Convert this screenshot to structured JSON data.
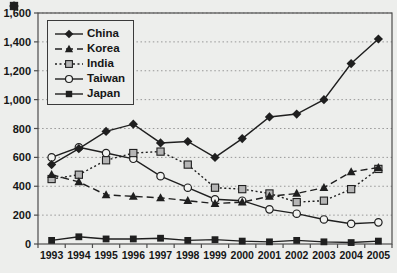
{
  "figure": {
    "background": "#edeeec",
    "ink": "#1f1f1f",
    "grid_color": "#979797",
    "border_color": "#4d4d4d",
    "india_fill": "#b5b5b5",
    "open_fill": "#f2f3f1"
  },
  "chart_data": {
    "type": "line",
    "title": "",
    "xlabel": "",
    "ylabel": "",
    "x": [
      1993,
      1994,
      1995,
      1996,
      1997,
      1998,
      1999,
      2000,
      2001,
      2002,
      2003,
      2004,
      2005
    ],
    "xtick_labels": [
      "1993",
      "1994",
      "1995",
      "1996",
      "1997",
      "1998",
      "1999",
      "2000",
      "2001",
      "2002",
      "2003",
      "2004",
      "2005"
    ],
    "ylim": [
      0,
      1600
    ],
    "ytick_step": 200,
    "ytick_labels": [
      "0",
      "200",
      "400",
      "600",
      "800",
      "1,000",
      "1,200",
      "1,400",
      "1,600"
    ],
    "grid": "horizontal-dotted",
    "legend_position": "top-left",
    "series": [
      {
        "name": "China",
        "marker": "diamond-filled",
        "line": "solid",
        "values": [
          550,
          660,
          780,
          830,
          700,
          710,
          600,
          730,
          880,
          900,
          1000,
          1250,
          1420
        ]
      },
      {
        "name": "Korea",
        "marker": "triangle-filled",
        "line": "dashed",
        "values": [
          480,
          430,
          340,
          330,
          320,
          300,
          280,
          290,
          330,
          350,
          390,
          500,
          530
        ]
      },
      {
        "name": "India",
        "marker": "square-open",
        "line": "dotted",
        "values": [
          450,
          480,
          580,
          630,
          640,
          550,
          390,
          380,
          350,
          290,
          300,
          380,
          520
        ]
      },
      {
        "name": "Taiwan",
        "marker": "circle-open",
        "line": "solid",
        "values": [
          600,
          670,
          630,
          590,
          470,
          390,
          310,
          300,
          240,
          210,
          170,
          140,
          150
        ]
      },
      {
        "name": "Japan",
        "marker": "square-filled",
        "line": "solid",
        "values": [
          25,
          50,
          35,
          35,
          40,
          25,
          30,
          20,
          15,
          25,
          15,
          10,
          20
        ]
      }
    ]
  }
}
